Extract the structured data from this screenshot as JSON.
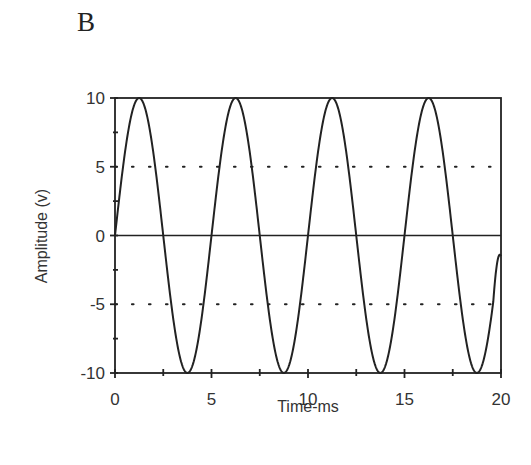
{
  "panel_label": "B",
  "chart_data": {
    "type": "line",
    "title": "",
    "xlabel": "Time-ms",
    "ylabel": "Amplitude (v)",
    "xlim": [
      0,
      20
    ],
    "ylim": [
      -10,
      10
    ],
    "x_ticks": [
      0,
      5,
      10,
      15,
      20
    ],
    "x_tick_labels": [
      "0",
      "5",
      "10",
      "15",
      "20"
    ],
    "y_ticks": [
      -10,
      -5,
      0,
      5,
      10
    ],
    "y_tick_labels": [
      "-10",
      "-5",
      "0",
      "5",
      "10"
    ],
    "grid": {
      "dotted_y": [
        5,
        -5
      ],
      "solid_y": [
        0
      ]
    },
    "legend": null,
    "series": [
      {
        "name": "sine wave",
        "function": "10*sin(2*pi*t/5)",
        "amplitude": 10,
        "period_ms": 5,
        "frequency_hz": 200,
        "x": [
          0,
          1.25,
          2.5,
          3.75,
          5,
          6.25,
          7.5,
          8.75,
          10,
          11.25,
          12.5,
          13.75,
          15,
          16.25,
          17.5,
          18.75,
          20
        ],
        "values": [
          0,
          10,
          0,
          -10,
          0,
          10,
          0,
          -10,
          0,
          10,
          0,
          -10,
          0,
          10,
          0,
          -10,
          -1.5
        ]
      }
    ]
  },
  "colors": {
    "line": "#222222",
    "axis": "#222222",
    "background": "#ffffff"
  }
}
